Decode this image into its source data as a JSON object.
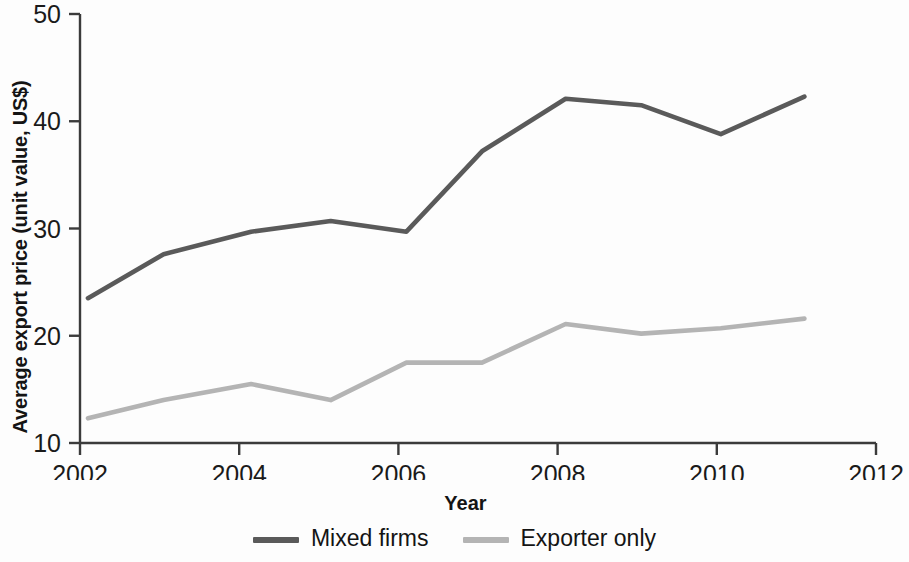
{
  "chart_data": {
    "type": "line",
    "title": "",
    "xlabel": "Year",
    "ylabel": "Average export price (unit value, US$)",
    "xlim": [
      2002,
      2012
    ],
    "ylim": [
      10,
      50
    ],
    "xticks": [
      "2002",
      "2004",
      "2006",
      "2008",
      "2010",
      "2012"
    ],
    "xtick_values": [
      2002,
      2004,
      2006,
      2008,
      2010,
      2012
    ],
    "yticks": [
      "10",
      "20",
      "30",
      "40",
      "50"
    ],
    "ytick_values": [
      10,
      20,
      30,
      40,
      50
    ],
    "grid": false,
    "legend_position": "bottom-center",
    "x": [
      2002.1,
      2003.05,
      2004.15,
      2005.15,
      2006.1,
      2007.05,
      2008.1,
      2009.05,
      2010.05,
      2011.1
    ],
    "series": [
      {
        "name": "Mixed firms",
        "color": "#5a5a5a",
        "values": [
          23.5,
          27.6,
          29.7,
          30.7,
          29.7,
          37.2,
          42.1,
          41.5,
          38.8,
          42.3
        ]
      },
      {
        "name": "Exporter only",
        "color": "#b4b4b4",
        "values": [
          12.3,
          14.0,
          15.5,
          14.0,
          17.5,
          17.5,
          21.1,
          20.2,
          20.7,
          21.6
        ]
      }
    ]
  },
  "axis": {
    "y_title": "Average export price (unit value, US$)",
    "x_title": "Year"
  },
  "legend": {
    "items": [
      {
        "label": "Mixed firms",
        "color": "#5a5a5a"
      },
      {
        "label": "Exporter only",
        "color": "#b4b4b4"
      }
    ]
  }
}
